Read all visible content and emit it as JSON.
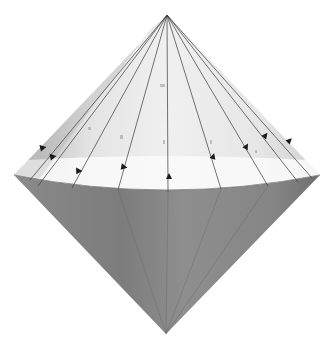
{
  "figure": {
    "width": 334,
    "height": 347,
    "colors": {
      "background": "#ffffff",
      "upper_cone_light": "#f2f2f2",
      "upper_cone_shade": "#c8c8c8",
      "upper_band": "#fbfbfb",
      "lower_cone": "#8c8c8c",
      "lower_cone_dark": "#6e6e6e",
      "line": "#3a3a3a",
      "arrow": "#1a1a1a"
    },
    "geometry": {
      "top_apex": [
        167,
        15
      ],
      "bottom_apex": [
        166,
        334
      ],
      "rim_left": [
        14,
        175
      ],
      "rim_right": [
        320,
        175
      ],
      "rim_front_y": 190,
      "rim_back_y": 160
    },
    "generators": [
      {
        "rim": [
          30,
          180
        ],
        "arrow": [
          42,
          148
        ]
      },
      {
        "rim": [
          38,
          186
        ],
        "arrow": [
          52,
          157
        ]
      },
      {
        "rim": [
          72,
          188
        ],
        "arrow": [
          78,
          171
        ]
      },
      {
        "rim": [
          118,
          190
        ],
        "arrow": [
          123,
          167
        ]
      },
      {
        "rim": [
          168,
          192
        ],
        "arrow": [
          169,
          177
        ]
      },
      {
        "rim": [
          221,
          189
        ],
        "arrow": [
          213,
          157
        ]
      },
      {
        "rim": [
          268,
          186
        ],
        "arrow": [
          246,
          147
        ]
      },
      {
        "rim": [
          298,
          182
        ],
        "arrow": [
          265,
          136
        ]
      },
      {
        "rim": [
          312,
          178
        ],
        "arrow": [
          289,
          141
        ]
      }
    ]
  }
}
